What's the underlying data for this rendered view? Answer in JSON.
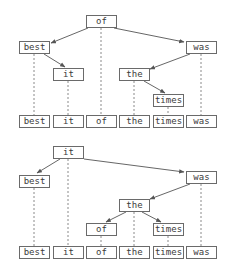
{
  "diagram": {
    "title": "",
    "trees": [
      {
        "name": "tree-1",
        "root": "of",
        "nodes": [
          {
            "id": "t1-of",
            "label": "of",
            "x": 86,
            "y": 15
          },
          {
            "id": "t1-best",
            "label": "best",
            "x": 19,
            "y": 41
          },
          {
            "id": "t1-was",
            "label": "was",
            "x": 186,
            "y": 41
          },
          {
            "id": "t1-it",
            "label": "it",
            "x": 53,
            "y": 68
          },
          {
            "id": "t1-the",
            "label": "the",
            "x": 119,
            "y": 68
          },
          {
            "id": "t1-times",
            "label": "times",
            "x": 153,
            "y": 94
          }
        ],
        "edges": [
          {
            "from": "of",
            "to": "best"
          },
          {
            "from": "of",
            "to": "was"
          },
          {
            "from": "best",
            "to": "it"
          },
          {
            "from": "was",
            "to": "the"
          },
          {
            "from": "the",
            "to": "times"
          }
        ],
        "leaves": [
          {
            "label": "best",
            "x": 19,
            "y": 115
          },
          {
            "label": "it",
            "x": 53,
            "y": 115
          },
          {
            "label": "of",
            "x": 86,
            "y": 115
          },
          {
            "label": "the",
            "x": 119,
            "y": 115
          },
          {
            "label": "times",
            "x": 153,
            "y": 115
          },
          {
            "label": "was",
            "x": 186,
            "y": 115
          }
        ]
      },
      {
        "name": "tree-2",
        "root": "it",
        "nodes": [
          {
            "id": "t2-it",
            "label": "it",
            "x": 53,
            "y": 146
          },
          {
            "id": "t2-best",
            "label": "best",
            "x": 19,
            "y": 175
          },
          {
            "id": "t2-was",
            "label": "was",
            "x": 186,
            "y": 171
          },
          {
            "id": "t2-the",
            "label": "the",
            "x": 119,
            "y": 199
          },
          {
            "id": "t2-of",
            "label": "of",
            "x": 86,
            "y": 223
          },
          {
            "id": "t2-times",
            "label": "times",
            "x": 153,
            "y": 223
          }
        ],
        "edges": [
          {
            "from": "it",
            "to": "best"
          },
          {
            "from": "it",
            "to": "was"
          },
          {
            "from": "was",
            "to": "the"
          },
          {
            "from": "the",
            "to": "of"
          },
          {
            "from": "the",
            "to": "times"
          }
        ],
        "leaves": [
          {
            "label": "best",
            "x": 19,
            "y": 246
          },
          {
            "label": "it",
            "x": 53,
            "y": 246
          },
          {
            "label": "of",
            "x": 86,
            "y": 246
          },
          {
            "label": "the",
            "x": 119,
            "y": 246
          },
          {
            "label": "times",
            "x": 153,
            "y": 246
          },
          {
            "label": "was",
            "x": 186,
            "y": 246
          }
        ]
      }
    ],
    "colors": {
      "border": "#6a6a6a",
      "text": "#3a3a3a",
      "edge": "#555555",
      "dashed": "#8a8a8a"
    }
  }
}
